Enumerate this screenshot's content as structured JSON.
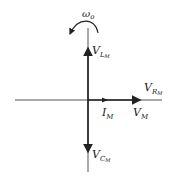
{
  "diagram": {
    "type": "phasor-diagram",
    "rotation_label": {
      "base": "ω",
      "sub": "o"
    },
    "phasors": [
      {
        "id": "VL",
        "base": "V",
        "sub": "L",
        "subsub": "M",
        "direction": "up"
      },
      {
        "id": "VR",
        "base": "V",
        "sub": "R",
        "subsub": "M",
        "direction": "right"
      },
      {
        "id": "IM",
        "base": "I",
        "sub": "M",
        "direction": "right"
      },
      {
        "id": "VM",
        "base": "V",
        "sub": "M",
        "direction": "right"
      },
      {
        "id": "VC",
        "base": "V",
        "sub": "C",
        "subsub": "M",
        "direction": "down"
      }
    ],
    "colors": {
      "line": "#333333",
      "axis": "#555555"
    }
  }
}
